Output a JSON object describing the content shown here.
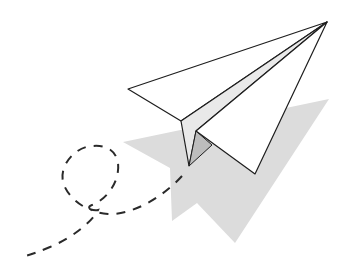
{
  "illustration": {
    "subject": "paper airplane with looping dashed flight trail",
    "colors": {
      "background": "#ffffff",
      "outline": "#1e1e1e",
      "paper": "#ffffff",
      "fold": "#e9e9e9",
      "inner_fold": "#bdbdbd",
      "shadow": "#dcdcdc",
      "trail": "#2a2a2a"
    }
  }
}
